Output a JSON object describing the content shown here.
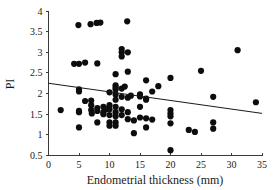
{
  "chart_data": {
    "type": "scatter",
    "title": "",
    "xlabel": "Endometrial thickness (mm)",
    "ylabel": "PI",
    "xlim": [
      0,
      35
    ],
    "ylim": [
      0.5,
      4
    ],
    "xticks": [
      0,
      5,
      10,
      15,
      20,
      25,
      30,
      35
    ],
    "yticks": [
      0.5,
      1,
      1.5,
      2,
      2.5,
      3,
      3.5,
      4
    ],
    "xtick_labels": [
      "0",
      "5",
      "10",
      "15",
      "20",
      "25",
      "30",
      "35"
    ],
    "ytick_labels": [
      "0.5",
      "1",
      "1.5",
      "2",
      "2.5",
      "3",
      "3.5",
      "4"
    ],
    "grid": false,
    "legend": null,
    "marker": "filled-circle",
    "marker_color": "#0d0d0d",
    "marker_size_px": 3.1,
    "trendline": {
      "type": "linear-regression",
      "color": "#1a1a1a",
      "x_start": 0,
      "y_start": 2.25,
      "x_end": 35,
      "y_end": 1.52,
      "slope": -0.0209,
      "intercept": 2.25
    },
    "series": [
      {
        "name": "PI vs endometrial thickness",
        "points": [
          [
            2.0,
            1.6
          ],
          [
            4.2,
            2.72
          ],
          [
            4.9,
            3.66
          ],
          [
            5.0,
            2.72
          ],
          [
            5.0,
            2.1
          ],
          [
            5.0,
            2.05
          ],
          [
            5.0,
            1.58
          ],
          [
            5.0,
            1.55
          ],
          [
            5.0,
            1.18
          ],
          [
            6.0,
            2.75
          ],
          [
            6.0,
            1.82
          ],
          [
            6.9,
            3.68
          ],
          [
            7.0,
            1.83
          ],
          [
            7.0,
            1.72
          ],
          [
            7.0,
            1.6
          ],
          [
            7.1,
            1.52
          ],
          [
            7.9,
            3.71
          ],
          [
            8.0,
            2.73
          ],
          [
            8.0,
            1.65
          ],
          [
            8.0,
            1.58
          ],
          [
            8.0,
            1.3
          ],
          [
            8.5,
            3.72
          ],
          [
            9.0,
            1.68
          ],
          [
            9.0,
            1.55
          ],
          [
            9.0,
            1.5
          ],
          [
            9.5,
            1.62
          ],
          [
            10.0,
            2.03
          ],
          [
            10.0,
            1.72
          ],
          [
            10.0,
            1.62
          ],
          [
            10.0,
            1.48
          ],
          [
            10.0,
            1.3
          ],
          [
            10.0,
            1.22
          ],
          [
            11.0,
            2.47
          ],
          [
            11.0,
            2.2
          ],
          [
            11.0,
            2.15
          ],
          [
            11.0,
            2.1
          ],
          [
            11.0,
            1.98
          ],
          [
            11.0,
            1.85
          ],
          [
            11.0,
            1.68
          ],
          [
            11.0,
            1.55
          ],
          [
            11.0,
            1.45
          ],
          [
            11.0,
            1.3
          ],
          [
            11.0,
            1.22
          ],
          [
            12.0,
            3.08
          ],
          [
            12.0,
            3.0
          ],
          [
            12.0,
            2.9
          ],
          [
            12.0,
            2.12
          ],
          [
            12.0,
            1.92
          ],
          [
            12.0,
            1.62
          ],
          [
            12.0,
            1.48
          ],
          [
            12.5,
            2.17
          ],
          [
            12.9,
            3.75
          ],
          [
            13.0,
            3.0
          ],
          [
            13.0,
            2.53
          ],
          [
            13.0,
            1.9
          ],
          [
            13.0,
            1.55
          ],
          [
            13.0,
            1.38
          ],
          [
            13.5,
            1.95
          ],
          [
            14.0,
            1.35
          ],
          [
            14.0,
            1.04
          ],
          [
            15.0,
            1.98
          ],
          [
            15.0,
            1.93
          ],
          [
            15.0,
            1.68
          ],
          [
            15.0,
            1.42
          ],
          [
            16.0,
            2.32
          ],
          [
            16.0,
            1.88
          ],
          [
            16.0,
            1.85
          ],
          [
            16.0,
            1.4
          ],
          [
            16.0,
            1.18
          ],
          [
            17.0,
            2.05
          ],
          [
            17.0,
            1.37
          ],
          [
            18.0,
            2.18
          ],
          [
            20.0,
            2.38
          ],
          [
            20.0,
            1.6
          ],
          [
            20.0,
            1.52
          ],
          [
            20.0,
            1.45
          ],
          [
            20.0,
            1.28
          ],
          [
            20.0,
            0.63
          ],
          [
            23.0,
            1.12
          ],
          [
            24.0,
            1.07
          ],
          [
            25.0,
            2.55
          ],
          [
            27.0,
            1.92
          ],
          [
            27.0,
            1.3
          ],
          [
            27.0,
            1.15
          ],
          [
            31.0,
            3.05
          ],
          [
            34.0,
            1.79
          ]
        ]
      }
    ]
  }
}
